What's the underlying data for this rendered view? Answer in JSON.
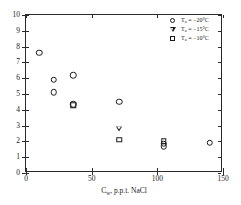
{
  "chart_data": {
    "type": "scatter",
    "title": "",
    "xlabel": "Cᵥ, p.p.t. NaCl",
    "xlabel_base": "C",
    "xlabel_sub": "w",
    "xlabel_rest": ", p.p.t. NaCl",
    "ylabel": "Critical thickness, cm",
    "xlim": [
      0,
      150
    ],
    "ylim": [
      0,
      10
    ],
    "xticks": [
      0,
      50,
      100,
      150
    ],
    "xtick_labels": [
      "0",
      "50",
      "100",
      "150"
    ],
    "yticks": [
      0,
      1,
      2,
      3,
      4,
      5,
      6,
      7,
      8,
      9,
      10
    ],
    "ytick_labels": [
      "0",
      "1",
      "2",
      "3",
      "4",
      "5",
      "6",
      "7",
      "8",
      "9",
      "10"
    ],
    "grid": false,
    "legend_position": "top-right",
    "series": [
      {
        "name": "Tₐ = -20°C",
        "marker": "circle",
        "points": [
          {
            "x": 10,
            "y": 7.6
          },
          {
            "x": 21,
            "y": 5.9
          },
          {
            "x": 21,
            "y": 5.1
          },
          {
            "x": 36,
            "y": 6.2
          },
          {
            "x": 36,
            "y": 4.35
          },
          {
            "x": 71,
            "y": 4.5
          },
          {
            "x": 105,
            "y": 1.85
          },
          {
            "x": 105,
            "y": 1.7
          },
          {
            "x": 140,
            "y": 1.9
          }
        ]
      },
      {
        "name": "Tₐ = -15°C",
        "marker": "triangle-down",
        "points": [
          {
            "x": 71,
            "y": 2.8
          }
        ]
      },
      {
        "name": "Tₐ = -10°C",
        "marker": "square",
        "points": [
          {
            "x": 36,
            "y": 4.3
          },
          {
            "x": 71,
            "y": 2.1
          },
          {
            "x": 105,
            "y": 2.0
          }
        ]
      }
    ]
  },
  "legend": {
    "entries": [
      {
        "symbol": "circle",
        "base": "T",
        "sub": "a",
        "rest": " = −20°C",
        "label": "Tₐ = −20°C"
      },
      {
        "symbol": "triangle-down",
        "base": "T",
        "sub": "a",
        "rest": " = −15°C",
        "label": "Tₐ = −15°C"
      },
      {
        "symbol": "square",
        "base": "T",
        "sub": "a",
        "rest": " = −10°C",
        "label": "Tₐ = −10°C"
      }
    ]
  },
  "colors": {
    "axis": "#2b2b2b",
    "marker": "#1a1a1a",
    "background": "#ffffff"
  }
}
